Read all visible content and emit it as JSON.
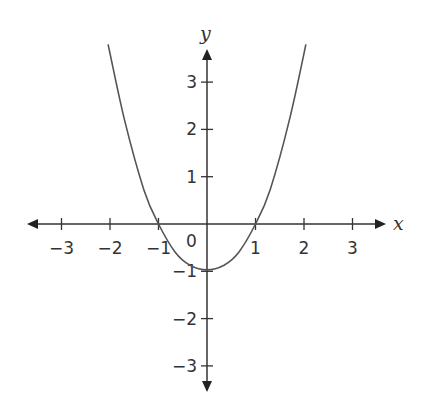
{
  "chart_data": {
    "type": "line",
    "title": "",
    "xlabel": "x",
    "ylabel": "y",
    "xlim": [
      -3.5,
      3.5
    ],
    "ylim": [
      -3.6,
      3.6
    ],
    "grid": false,
    "legend": null,
    "x_ticks": [
      -3,
      -2,
      -1,
      1,
      2,
      3
    ],
    "x_tick_labels": [
      "−3",
      "−2",
      "−1",
      "1",
      "2",
      "3"
    ],
    "y_ticks": [
      3,
      2,
      1,
      -1,
      -2,
      -3
    ],
    "y_tick_labels": [
      "3",
      "2",
      "1",
      "−1",
      "−2",
      "−3"
    ],
    "origin_label": "0",
    "series": [
      {
        "name": "parabola",
        "description": "Upward-opening parabola, vertex near (0, -1), x-intercepts at -1 and 1",
        "x": [
          -2.04,
          -1.7,
          -1.3,
          -1.0,
          -0.66,
          -0.35,
          0.0,
          0.35,
          0.66,
          1.0,
          1.3,
          1.7,
          2.04
        ],
        "y": [
          3.8,
          2.2,
          0.72,
          0.0,
          -0.59,
          -0.87,
          -0.97,
          -0.87,
          -0.59,
          0.0,
          0.72,
          2.2,
          3.8
        ]
      }
    ],
    "annotations": {
      "vertex": [
        0,
        -0.97
      ],
      "x_intercepts": [
        -1,
        1
      ]
    }
  },
  "colors": {
    "axis": "#333333",
    "curve": "#555555",
    "text": "#333333",
    "background": "#ffffff"
  }
}
